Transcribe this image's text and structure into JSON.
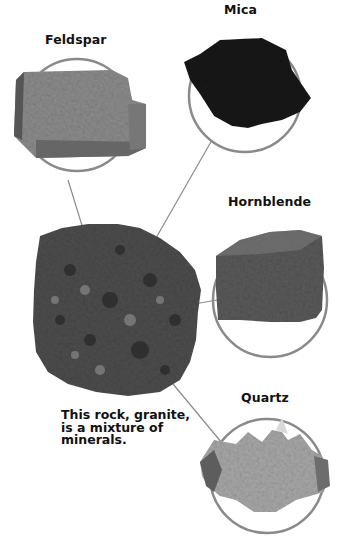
{
  "diagram": {
    "caption_lines": [
      "This rock, granite,",
      "is a mixture of",
      "minerals."
    ],
    "rock": {
      "name": "granite"
    },
    "minerals": [
      {
        "label": "Feldspar"
      },
      {
        "label": "Mica"
      },
      {
        "label": "Hornblende"
      },
      {
        "label": "Quartz"
      }
    ],
    "colors": {
      "circle_stroke": "#8a8a8a",
      "leader_line": "#8a8a8a",
      "text": "#111111"
    }
  }
}
